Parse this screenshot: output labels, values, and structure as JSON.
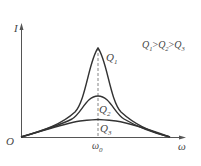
{
  "diagram": {
    "y_axis_label": "I",
    "x_axis_label": "ω",
    "origin_label": "O",
    "resonance_label": "ω",
    "resonance_sub": "0",
    "legend": {
      "q1": "Q",
      "q1_sub": "1",
      "gt1": ">",
      "q2": "Q",
      "q2_sub": "2",
      "gt2": ">",
      "q3": "Q",
      "q3_sub": "3"
    },
    "curves": [
      {
        "name": "Q",
        "sub": "1",
        "peak_height": "high"
      },
      {
        "name": "Q",
        "sub": "2",
        "peak_height": "medium"
      },
      {
        "name": "Q",
        "sub": "3",
        "peak_height": "low"
      }
    ],
    "colors": {
      "line": "#333333",
      "axis": "#555555",
      "dashed": "#666666"
    }
  }
}
